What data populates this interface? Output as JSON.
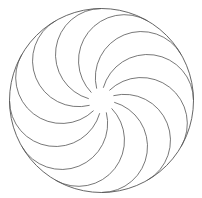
{
  "figure": {
    "title": "",
    "center": [
      101.5,
      100.5
    ],
    "outer_radius": 92,
    "arc_count": 12,
    "arc_radius": 46,
    "stroke_color": "#555555",
    "background": "#ffffff"
  }
}
